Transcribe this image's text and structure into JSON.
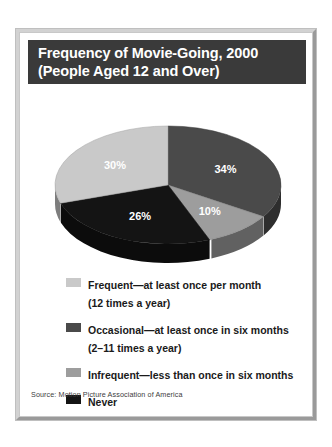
{
  "figure": {
    "title_line_1": "Frequency of Movie-Going, 2000",
    "title_line_2": "(People Aged 12 and Over)",
    "source": "Source: Motion Picture Association of America"
  },
  "colors": {
    "frequent": "#c9c9c9",
    "occasional": "#4a4a4a",
    "infrequent": "#9d9d9d",
    "never": "#141414",
    "title_bar": "#3a3a3a",
    "frame_light": "#d2d2d2",
    "frame_dark": "#9a9a9a",
    "label_text": "#ffffff"
  },
  "legend": {
    "items": [
      {
        "swatch": "frequent",
        "label": "Frequent—at least once per month",
        "sub": "(12 times a year)"
      },
      {
        "swatch": "occasional",
        "label": "Occasional—at least once in six months",
        "sub": "(2–11 times a year)"
      },
      {
        "swatch": "infrequent",
        "label": "Infrequent—less than once in six months",
        "sub": ""
      },
      {
        "swatch": "never",
        "label": "Never",
        "sub": ""
      }
    ]
  },
  "chart_data": {
    "type": "pie",
    "title": "Frequency of Movie-Going, 2000 (People Aged 12 and Over)",
    "xlabel": "",
    "ylabel": "",
    "legend_position": "bottom",
    "grid": false,
    "three_d": true,
    "start_angle_deg": 0,
    "direction": "clockwise",
    "labels": [
      "Occasional",
      "Infrequent",
      "Never",
      "Frequent"
    ],
    "values": [
      34,
      10,
      26,
      30
    ],
    "value_labels": [
      "34%",
      "10%",
      "26%",
      "30%"
    ],
    "unit": "percent",
    "slice_colors": [
      "#4a4a4a",
      "#9d9d9d",
      "#141414",
      "#c9c9c9"
    ],
    "slices": [
      {
        "label": "Occasional",
        "legend_label": "Occasional—at least once in six months (2–11 times a year)",
        "value": 34,
        "display": "34%",
        "color": "#4a4a4a"
      },
      {
        "label": "Infrequent",
        "legend_label": "Infrequent—less than once in six months",
        "value": 10,
        "display": "10%",
        "color": "#9d9d9d"
      },
      {
        "label": "Never",
        "legend_label": "Never",
        "value": 26,
        "display": "26%",
        "color": "#141414"
      },
      {
        "label": "Frequent",
        "legend_label": "Frequent—at least once per month (12 times a year)",
        "value": 30,
        "display": "30%",
        "color": "#c9c9c9"
      }
    ],
    "total": 100,
    "source": "Source: Motion Picture Association of America"
  }
}
